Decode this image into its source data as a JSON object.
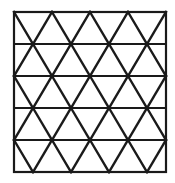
{
  "figure": {
    "name": "triangular-tessellation",
    "canvas": {
      "width": 175,
      "height": 183
    },
    "background_color": "#ffffff",
    "stroke_color": "#1a1a1a",
    "border_color": "#1a1a1a"
  },
  "chart_data": {
    "type": "diagram",
    "title": "",
    "subtitle": "",
    "xlabel": "",
    "ylabel": "",
    "grid": true,
    "legend": null,
    "pattern": "triangular-grid",
    "frame": {
      "left": 14,
      "top": 12,
      "right": 166,
      "bottom": 172,
      "width": 152,
      "height": 160,
      "stroke_width": 2.2
    },
    "rows": 5,
    "columns": 4,
    "row_boundaries_y": [
      12,
      44,
      76,
      108,
      140,
      172
    ],
    "row_height": 32,
    "column_width": 38,
    "cell_boundaries_x": [
      14,
      52,
      90,
      128,
      166
    ],
    "midpoints_x": [
      33,
      71,
      109,
      147
    ],
    "diagonal_stroke_width": 2.4,
    "horizontal_stroke_width": 1.8,
    "row_phase": [
      "down",
      "up",
      "down",
      "up",
      "down"
    ],
    "row_phase_note": "down = apex-down triangles start at left edge; up = apex-up triangles start at left edge",
    "triangle_count_total": 40
  }
}
